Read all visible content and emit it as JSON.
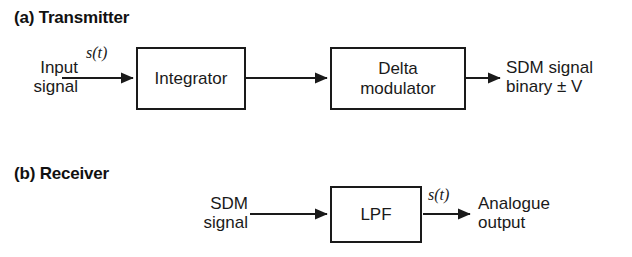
{
  "figure": {
    "type": "block-diagram",
    "background_color": "#ffffff",
    "line_color": "#1a1a1a",
    "text_color": "#1a1a1a"
  },
  "transmitter": {
    "heading": "(a) Transmitter",
    "input_label": "Input\nsignal",
    "input_signal_label": "s(t)",
    "blocks": [
      {
        "name": "integrator",
        "label": "Integrator"
      },
      {
        "name": "delta-modulator",
        "label": "Delta\nmodulator"
      }
    ],
    "output_label": "SDM signal\nbinary ± V"
  },
  "receiver": {
    "heading": "(b) Receiver",
    "input_label": "SDM\nsignal",
    "blocks": [
      {
        "name": "lpf",
        "label": "LPF"
      }
    ],
    "output_signal_label": "s(t)",
    "output_label": "Analogue\noutput"
  }
}
